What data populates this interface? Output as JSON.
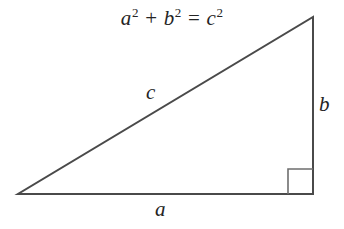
{
  "figure": {
    "background_color": "#ffffff",
    "stroke_color": "#4a4a4a",
    "right_angle_stroke_color": "#6e6e6e",
    "text_color": "#242424"
  },
  "equation": {
    "full_text": "a² + b² = c²",
    "term_a_base": "a",
    "term_a_exponent": "2",
    "plus_operator": "+",
    "term_b_base": "b",
    "term_b_exponent": "2",
    "equals_operator": "=",
    "term_c_base": "c",
    "term_c_exponent": "2"
  },
  "labels": {
    "hypotenuse": "c",
    "vertical_leg": "b",
    "horizontal_leg": "a"
  },
  "geometry": {
    "left_vertex": {
      "x": 18,
      "y": 194
    },
    "right_vertex": {
      "x": 313,
      "y": 194
    },
    "top_vertex": {
      "x": 313,
      "y": 17
    },
    "right_angle_marker": {
      "x": 288,
      "y": 169,
      "size": 25
    },
    "stroke_width": 2
  }
}
